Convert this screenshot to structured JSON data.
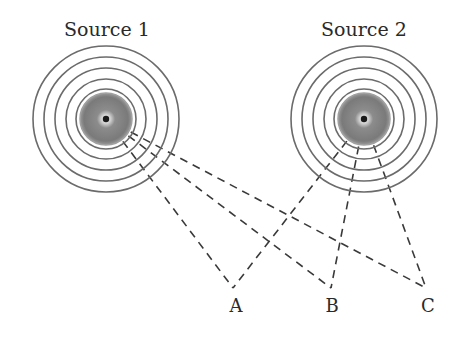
{
  "diagram": {
    "colors": {
      "ring": "#6b6b6b",
      "disc": "#8a8a8a",
      "disc_edge": "#a0a0a0",
      "center": "#1a1a1a",
      "dash": "#3a3a3a",
      "text": "#2a2a2a"
    },
    "sources": [
      {
        "id": "source-1",
        "label": "Source 1",
        "cx": 106,
        "cy": 119,
        "label_x": 107,
        "label_y": 36
      },
      {
        "id": "source-2",
        "label": "Source 2",
        "cx": 364,
        "cy": 119,
        "label_x": 364,
        "label_y": 36
      }
    ],
    "ring_radii": [
      73,
      62,
      51,
      40,
      30
    ],
    "disc_radius": 26,
    "points": [
      {
        "id": "A",
        "label": "A",
        "x": 233,
        "y": 288,
        "label_x": 236,
        "label_y": 312
      },
      {
        "id": "B",
        "label": "B",
        "x": 331,
        "y": 288,
        "label_x": 332,
        "label_y": 312
      },
      {
        "id": "C",
        "label": "C",
        "x": 426,
        "y": 288,
        "label_x": 428,
        "label_y": 312
      }
    ]
  }
}
